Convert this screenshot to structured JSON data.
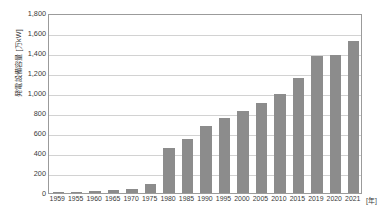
{
  "chart_data": {
    "type": "bar",
    "title": "",
    "subtitle": "",
    "xlabel": "",
    "ylabel": "発電設備容量 [万kW]",
    "x_unit": "[年]",
    "categories": [
      "1959",
      "1955",
      "1960",
      "1965",
      "1970",
      "1975",
      "1980",
      "1985",
      "1990",
      "1995",
      "2000",
      "2005",
      "2010",
      "2015",
      "2019",
      "2020",
      "2021"
    ],
    "values": [
      10,
      12,
      24,
      30,
      42,
      92,
      454,
      544,
      668,
      748,
      818,
      902,
      990,
      1152,
      1370,
      1385,
      1520
    ],
    "ylim": [
      0,
      1800
    ],
    "y_ticks": [
      0,
      200,
      400,
      600,
      800,
      1000,
      1200,
      1400,
      1600,
      1800
    ],
    "y_tick_labels": [
      "0",
      "200",
      "400",
      "600",
      "800",
      "1,000",
      "1,200",
      "1,400",
      "1,600",
      "1,800"
    ],
    "grid": "horizontal",
    "legend": "none",
    "bar_color": "#8c8c8c",
    "grid_color": "#d2d2d2",
    "frame_color": "#9b9b9b"
  },
  "caption": {
    "text": ""
  }
}
